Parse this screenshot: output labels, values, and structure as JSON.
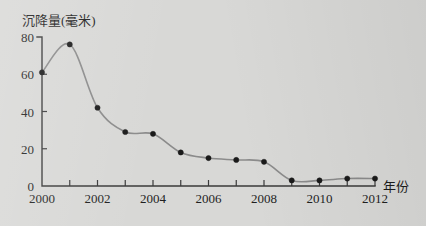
{
  "chart_data": {
    "type": "line",
    "title": "",
    "ylabel": "沉降量(毫米)",
    "xlabel": "年份",
    "x": [
      2000,
      2001,
      2002,
      2003,
      2004,
      2005,
      2006,
      2007,
      2008,
      2009,
      2010,
      2011,
      2012
    ],
    "values": [
      61,
      76,
      42,
      29,
      28,
      18,
      15,
      14,
      13,
      3,
      3,
      4,
      4
    ],
    "series": [
      {
        "name": "沉降量",
        "values": [
          61,
          76,
          42,
          29,
          28,
          18,
          15,
          14,
          13,
          3,
          3,
          4,
          4
        ]
      }
    ],
    "xlim": [
      2000,
      2012
    ],
    "ylim": [
      0,
      80
    ],
    "y_ticks": [
      0,
      20,
      40,
      60,
      80
    ],
    "y_tick_labels": [
      "0",
      "20",
      "40",
      "60",
      "80"
    ],
    "x_ticks": [
      2000,
      2001,
      2002,
      2003,
      2004,
      2005,
      2006,
      2007,
      2008,
      2009,
      2010,
      2011,
      2012
    ],
    "x_tick_labels_shown": [
      "2000",
      "2002",
      "2004",
      "2006",
      "2008",
      "2010",
      "2012"
    ],
    "grid": false,
    "legend": "none",
    "line_color": "#8b8b8b",
    "marker_color": "#1a1a1a",
    "axis_color": "#3a3a3a",
    "background_color": "#d8d8d6"
  }
}
